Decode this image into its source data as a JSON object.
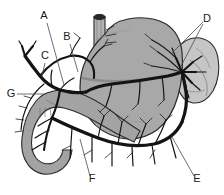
{
  "figure": {
    "width": 224,
    "height": 195,
    "background_color": "#ffffff"
  },
  "colors": {
    "background": "#ffffff",
    "stomach_fill": "#a8a8a8",
    "duodenum_fill": "#a3a3a3",
    "spleen_fill": "#c6c6c6",
    "esophagus_fill": "#b4b4b4",
    "esophagus_lumen": "#2a2a2a",
    "vessel_stroke": "#141414",
    "outline_stroke": "#2b2b2b",
    "leader_stroke": "#4a4a4a",
    "label_text": "#1a1a1a"
  },
  "labels": [
    {
      "id": "A",
      "text": "A",
      "x": 44,
      "y": 19,
      "anchor": "middle",
      "leader": {
        "x1": 47,
        "y1": 23,
        "x2": 64,
        "y2": 85
      }
    },
    {
      "id": "B",
      "text": "B",
      "x": 67,
      "y": 40,
      "anchor": "middle",
      "leader": {
        "x1": 70,
        "y1": 44,
        "x2": 78,
        "y2": 72
      }
    },
    {
      "id": "C",
      "text": "C",
      "x": 45,
      "y": 59,
      "anchor": "middle",
      "leader": {
        "x1": 45,
        "y1": 63,
        "x2": 42,
        "y2": 76
      }
    },
    {
      "id": "D",
      "text": "D",
      "x": 207,
      "y": 22,
      "anchor": "middle",
      "leader": {
        "x1": 203,
        "y1": 22,
        "x2": 172,
        "y2": 53
      },
      "leader2": {
        "x1": 203,
        "y1": 24,
        "x2": 180,
        "y2": 68
      }
    },
    {
      "id": "E",
      "text": "E",
      "x": 197,
      "y": 182,
      "anchor": "middle",
      "leader": {
        "x1": 194,
        "y1": 176,
        "x2": 172,
        "y2": 137
      }
    },
    {
      "id": "F",
      "text": "F",
      "x": 92,
      "y": 182,
      "anchor": "middle",
      "leader": {
        "x1": 90,
        "y1": 176,
        "x2": 80,
        "y2": 139
      }
    },
    {
      "id": "G",
      "text": "G",
      "x": 11,
      "y": 97,
      "anchor": "middle",
      "leader": {
        "x1": 17,
        "y1": 94,
        "x2": 44,
        "y2": 94
      }
    }
  ],
  "organs": [
    {
      "name": "stomach",
      "label": "Stomach",
      "fill": "#a8a8a8"
    },
    {
      "name": "spleen",
      "label": "Spleen",
      "fill": "#c6c6c6"
    },
    {
      "name": "duodenum",
      "label": "Duodenum",
      "fill": "#a3a3a3"
    },
    {
      "name": "esophagus",
      "label": "Esophagus",
      "fill": "#b4b4b4"
    }
  ],
  "vessels": [
    {
      "name": "celiac-trunk",
      "label": "Celiac trunk"
    },
    {
      "name": "common-hepatic-artery",
      "label": "Common hepatic artery"
    },
    {
      "name": "hepatic-branches",
      "label": "Hepatic branches"
    },
    {
      "name": "left-gastric-artery",
      "label": "Left gastric artery"
    },
    {
      "name": "splenic-artery",
      "label": "Splenic artery"
    },
    {
      "name": "gastroduodenal-artery",
      "label": "Gastroduodenal artery"
    },
    {
      "name": "right-gastroepiploic-artery",
      "label": "Right gastroepiploic artery"
    },
    {
      "name": "left-gastroepiploic-artery",
      "label": "Left gastroepiploic artery"
    },
    {
      "name": "short-gastric-arteries",
      "label": "Short gastric arteries"
    }
  ]
}
